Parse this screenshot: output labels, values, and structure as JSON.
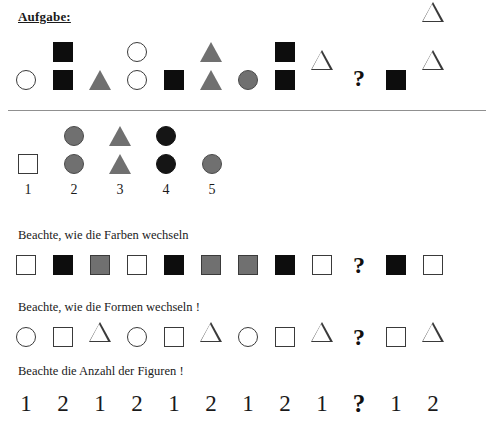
{
  "title": "Aufgabe:",
  "colors": {
    "black": "#0d0d0d",
    "gray": "#707070",
    "white": "#ffffff",
    "outline": "#3a3a3a",
    "divider": "#909090"
  },
  "question_mark": "?",
  "puzzle": {
    "name": "main-sequence",
    "cells": [
      {
        "shape": "circle",
        "fill": "white",
        "count": 1
      },
      {
        "shape": "square",
        "fill": "black",
        "count": 2
      },
      {
        "shape": "triangle",
        "fill": "gray",
        "count": 1
      },
      {
        "shape": "circle",
        "fill": "white",
        "count": 2
      },
      {
        "shape": "square",
        "fill": "black",
        "count": 1
      },
      {
        "shape": "triangle",
        "fill": "gray",
        "count": 2
      },
      {
        "shape": "circle",
        "fill": "gray",
        "count": 1
      },
      {
        "shape": "square",
        "fill": "black",
        "count": 2
      },
      {
        "shape": "triangle",
        "fill": "white",
        "count": 1
      },
      {
        "shape": "question",
        "fill": "none",
        "count": 1
      },
      {
        "shape": "square",
        "fill": "black",
        "count": 1
      },
      {
        "shape": "triangle",
        "fill": "white",
        "count": 2
      }
    ]
  },
  "options": {
    "name": "answer-options",
    "items": [
      {
        "label": "1",
        "shape": "square",
        "fill": "white",
        "count": 1
      },
      {
        "label": "2",
        "shape": "circle",
        "fill": "gray",
        "count": 2
      },
      {
        "label": "3",
        "shape": "triangle",
        "fill": "gray",
        "count": 2
      },
      {
        "label": "4",
        "shape": "circle",
        "fill": "black",
        "count": 2
      },
      {
        "label": "5",
        "shape": "circle",
        "fill": "gray",
        "count": 1
      }
    ]
  },
  "hints": [
    {
      "text": "Beachte, wie die Farben wechseln",
      "strip_name": "color-pattern-strip",
      "strip": [
        {
          "shape": "square",
          "fill": "white"
        },
        {
          "shape": "square",
          "fill": "black"
        },
        {
          "shape": "square",
          "fill": "gray"
        },
        {
          "shape": "square",
          "fill": "white"
        },
        {
          "shape": "square",
          "fill": "black"
        },
        {
          "shape": "square",
          "fill": "gray"
        },
        {
          "shape": "square",
          "fill": "gray"
        },
        {
          "shape": "square",
          "fill": "black"
        },
        {
          "shape": "square",
          "fill": "white"
        },
        {
          "shape": "question",
          "fill": "none"
        },
        {
          "shape": "square",
          "fill": "black"
        },
        {
          "shape": "square",
          "fill": "white"
        }
      ]
    },
    {
      "text": "Beachte, wie die Formen wechseln !",
      "strip_name": "shape-pattern-strip",
      "strip": [
        {
          "shape": "circle",
          "fill": "white"
        },
        {
          "shape": "square",
          "fill": "white"
        },
        {
          "shape": "triangle",
          "fill": "white"
        },
        {
          "shape": "circle",
          "fill": "white"
        },
        {
          "shape": "square",
          "fill": "white"
        },
        {
          "shape": "triangle",
          "fill": "white"
        },
        {
          "shape": "circle",
          "fill": "white"
        },
        {
          "shape": "square",
          "fill": "white"
        },
        {
          "shape": "triangle",
          "fill": "white"
        },
        {
          "shape": "question",
          "fill": "none"
        },
        {
          "shape": "square",
          "fill": "white"
        },
        {
          "shape": "triangle",
          "fill": "white"
        }
      ]
    },
    {
      "text": "Beachte die Anzahl der Figuren !",
      "strip_name": "count-pattern-strip",
      "strip": [
        {
          "text": "1"
        },
        {
          "text": "2"
        },
        {
          "text": "1"
        },
        {
          "text": "2"
        },
        {
          "text": "1"
        },
        {
          "text": "2"
        },
        {
          "text": "1"
        },
        {
          "text": "2"
        },
        {
          "text": "1"
        },
        {
          "text": "?"
        },
        {
          "text": "1"
        },
        {
          "text": "2"
        }
      ]
    }
  ]
}
